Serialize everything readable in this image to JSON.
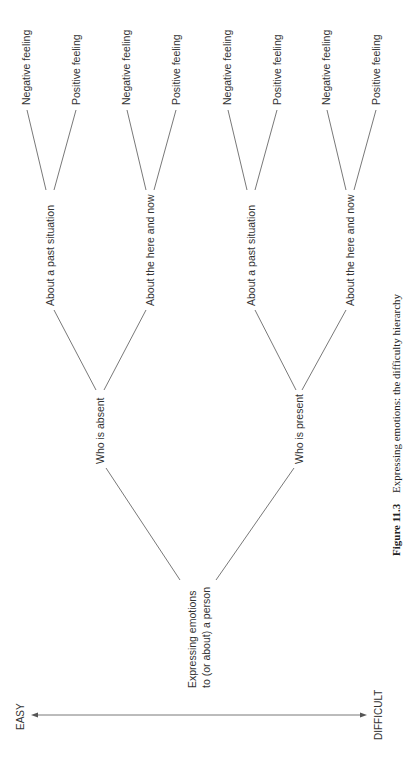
{
  "diagram": {
    "orientation": "rotated-90-ccw",
    "root": {
      "line1": "Expressing emotions",
      "line2": "to (or about) a person"
    },
    "level1": [
      {
        "label": "Who is absent"
      },
      {
        "label": "Who is present"
      }
    ],
    "level2": [
      {
        "label": "About a past situation"
      },
      {
        "label": "About the here and now"
      },
      {
        "label": "About a past situation"
      },
      {
        "label": "About the here and now"
      }
    ],
    "leaves": [
      {
        "label": "Negative feeling"
      },
      {
        "label": "Positive feeling"
      },
      {
        "label": "Negative feeling"
      },
      {
        "label": "Positive feeling"
      },
      {
        "label": "Negative feeling"
      },
      {
        "label": "Positive feeling"
      },
      {
        "label": "Negative feeling"
      },
      {
        "label": "Positive feeling"
      }
    ],
    "axis": {
      "start_label": "EASY",
      "end_label": "DIFFICULT"
    },
    "caption": {
      "number": "Figure 11.3",
      "text": "Expressing emotions: the difficulty hierarchy"
    },
    "colors": {
      "line": "#555555",
      "text": "#333333",
      "background": "#ffffff"
    }
  }
}
